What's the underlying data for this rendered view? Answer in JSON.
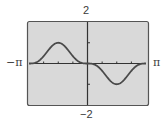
{
  "chart_data": {
    "type": "line",
    "title": "",
    "xlabel": "",
    "ylabel": "",
    "xlim": [
      -3.14159,
      3.14159
    ],
    "ylim": [
      -2,
      2
    ],
    "x_range_labels": {
      "min": "−π",
      "max": "π"
    },
    "y_range_labels": {
      "min": "−2",
      "max": "2"
    },
    "x_ticks_per_side": 3,
    "y_ticks": [
      -1,
      1
    ],
    "grid": false,
    "legend": null,
    "series": [
      {
        "name": "f(x) = −sin³(x)",
        "x": [
          -3.1416,
          -2.7489,
          -2.3562,
          -1.9635,
          -1.5708,
          -1.1781,
          -0.7854,
          -0.3927,
          0,
          0.3927,
          0.7854,
          1.1781,
          1.5708,
          1.9635,
          2.3562,
          2.7489,
          3.1416
        ],
        "values": [
          0,
          0.056,
          0.354,
          0.789,
          1.0,
          0.789,
          0.354,
          0.056,
          0,
          -0.056,
          -0.354,
          -0.789,
          -1.0,
          -0.789,
          -0.354,
          -0.056,
          0
        ]
      }
    ],
    "colors": {
      "plot_bg": "#d9d9d9",
      "frame": "#555555",
      "curve": "#4a4a4a",
      "axes": "#333333"
    }
  }
}
